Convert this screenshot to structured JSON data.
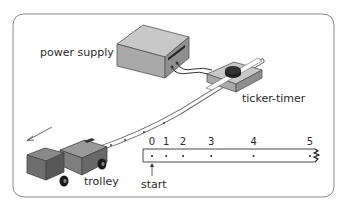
{
  "diagram": {
    "labels": {
      "power_supply": "power supply",
      "ticker_timer": "ticker-timer",
      "trolley": "trolley",
      "start": "start"
    },
    "tape_dot_labels": [
      "0",
      "1",
      "2",
      "3",
      "4",
      "5"
    ],
    "tape_dot_positions": [
      0,
      1,
      2.2,
      4.2,
      7.2,
      11.2
    ],
    "colors": {
      "frame": "#8a8a8a",
      "box_top": "#c8c8c8",
      "box_front": "#a9a9a9",
      "box_side": "#8f8f8f",
      "tape": "#ffffff",
      "ink": "#2a2a2a"
    }
  }
}
